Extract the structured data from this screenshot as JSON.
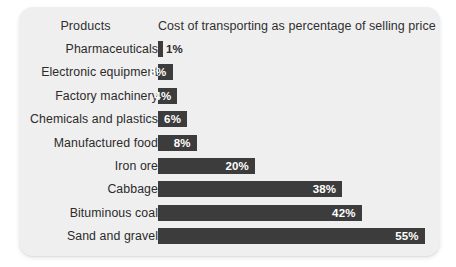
{
  "chart_data": {
    "type": "bar",
    "orientation": "horizontal",
    "title": "",
    "column_headers": {
      "category": "Products",
      "value": "Cost of transporting as percentage of selling price"
    },
    "categories": [
      "Pharmaceuticals",
      "Electronic equipment",
      "Factory machinery",
      "Chemicals and plastics",
      "Manufactured food",
      "Iron ore",
      "Cabbage",
      "Bituminous coal",
      "Sand and gravel"
    ],
    "values": [
      1,
      3,
      4,
      6,
      8,
      20,
      38,
      42,
      55
    ],
    "data_labels": [
      "1%",
      "3%",
      "4%",
      "6%",
      "8%",
      "20%",
      "38%",
      "42%",
      "55%"
    ],
    "label_placement": [
      "outside",
      "inside",
      "inside",
      "inside",
      "inside",
      "inside",
      "inside",
      "inside",
      "inside"
    ],
    "xlabel": "",
    "ylabel": "",
    "xlim": [
      0,
      58
    ],
    "grid": false,
    "legend": false,
    "units": "percent",
    "bar_color": "#3c3c3c",
    "card_background": "#f0efef",
    "page_background": "#ffffff",
    "text_color": "#2b2b2b",
    "value_text_color_inside": "#ffffff"
  }
}
